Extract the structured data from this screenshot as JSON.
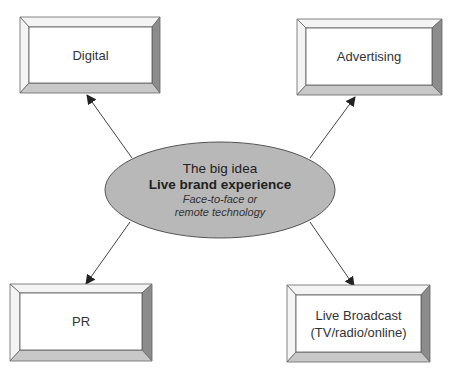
{
  "diagram": {
    "center": {
      "title": "The big idea",
      "headline": "Live brand experience",
      "subtitle_line1": "Face-to-face or",
      "subtitle_line2": "remote technology",
      "fill_color": "#b8b8b8",
      "stroke_color": "#555555"
    },
    "nodes": [
      {
        "id": "digital",
        "label_line1": "Digital",
        "label_line2": ""
      },
      {
        "id": "advertising",
        "label_line1": "Advertising",
        "label_line2": ""
      },
      {
        "id": "pr",
        "label_line1": "PR",
        "label_line2": ""
      },
      {
        "id": "live-broadcast",
        "label_line1": "Live Broadcast",
        "label_line2": "(TV/radio/online)"
      }
    ],
    "colors": {
      "box_face": "#ffffff",
      "bevel_light": "#f2f2f2",
      "bevel_mid": "#cfcfcf",
      "bevel_dark": "#8a8a8a",
      "outline": "#555555",
      "arrow": "#444444"
    }
  }
}
